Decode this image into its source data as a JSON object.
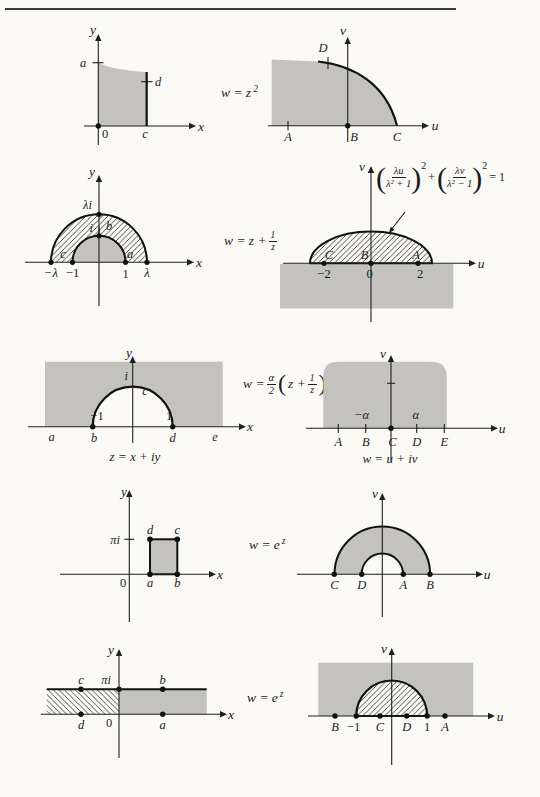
{
  "rows": [
    {
      "formula": {
        "base": "w = z",
        "sup": "2"
      },
      "z": {
        "y": "y",
        "x": "x",
        "a": "a",
        "d": "d",
        "zero": "0",
        "c": "c"
      },
      "w": {
        "v": "v",
        "u": "u",
        "A": "A",
        "B": "B",
        "C": "C",
        "D": "D"
      }
    },
    {
      "formula": {
        "lhs": "w = z +",
        "num": "1",
        "den": "z"
      },
      "z": {
        "y": "y",
        "x": "x",
        "lambda_i": "λi",
        "i": "i",
        "b": "b",
        "c": "c",
        "a": "a",
        "neg_lambda": "−λ",
        "neg_one": "−1",
        "one": "1",
        "lambda": "λ"
      },
      "w": {
        "v": "v",
        "u": "u",
        "C": "C",
        "B": "B",
        "A": "A",
        "neg_two": "−2",
        "zero": "0",
        "two": "2",
        "eq": {
          "f1num": "λu",
          "f1den": "λ² + 1",
          "sup1": "2",
          "plus": "+",
          "f2num": "λv",
          "f2den": "λ² − 1",
          "sup2": "2",
          "rhs": "= 1"
        }
      }
    },
    {
      "formula": {
        "lhs": "w =",
        "num1": "α",
        "den1": "2",
        "open": "(",
        "mid": "z +",
        "num2": "1",
        "den2": "z",
        "close": ")"
      },
      "z": {
        "y": "y",
        "x": "x",
        "i": "i",
        "c": "c",
        "neg_one": "−1",
        "one": "1",
        "a": "a",
        "b": "b",
        "d": "d",
        "e": "e",
        "caption": "z = x + iy"
      },
      "w": {
        "v": "v",
        "u": "u",
        "neg_alpha": "−α",
        "alpha": "α",
        "A": "A",
        "B": "B",
        "C": "C",
        "D": "D",
        "E": "E",
        "caption": "w = u + iv"
      }
    },
    {
      "formula": {
        "base": "w = e",
        "sup": "z"
      },
      "z": {
        "y": "y",
        "x": "x",
        "pi_i": "πi",
        "d": "d",
        "c": "c",
        "a": "a",
        "b": "b",
        "zero": "0"
      },
      "w": {
        "v": "v",
        "u": "u",
        "C": "C",
        "D": "D",
        "A": "A",
        "B": "B"
      }
    },
    {
      "formula": {
        "base": "w = e",
        "sup": "z"
      },
      "z": {
        "y": "y",
        "x": "x",
        "c": "c",
        "pi_i": "πi",
        "b": "b",
        "d": "d",
        "zero": "0",
        "a": "a"
      },
      "w": {
        "v": "v",
        "u": "u",
        "B": "B",
        "neg_one": "−1",
        "C": "C",
        "D": "D",
        "one": "1",
        "A": "A"
      }
    }
  ]
}
